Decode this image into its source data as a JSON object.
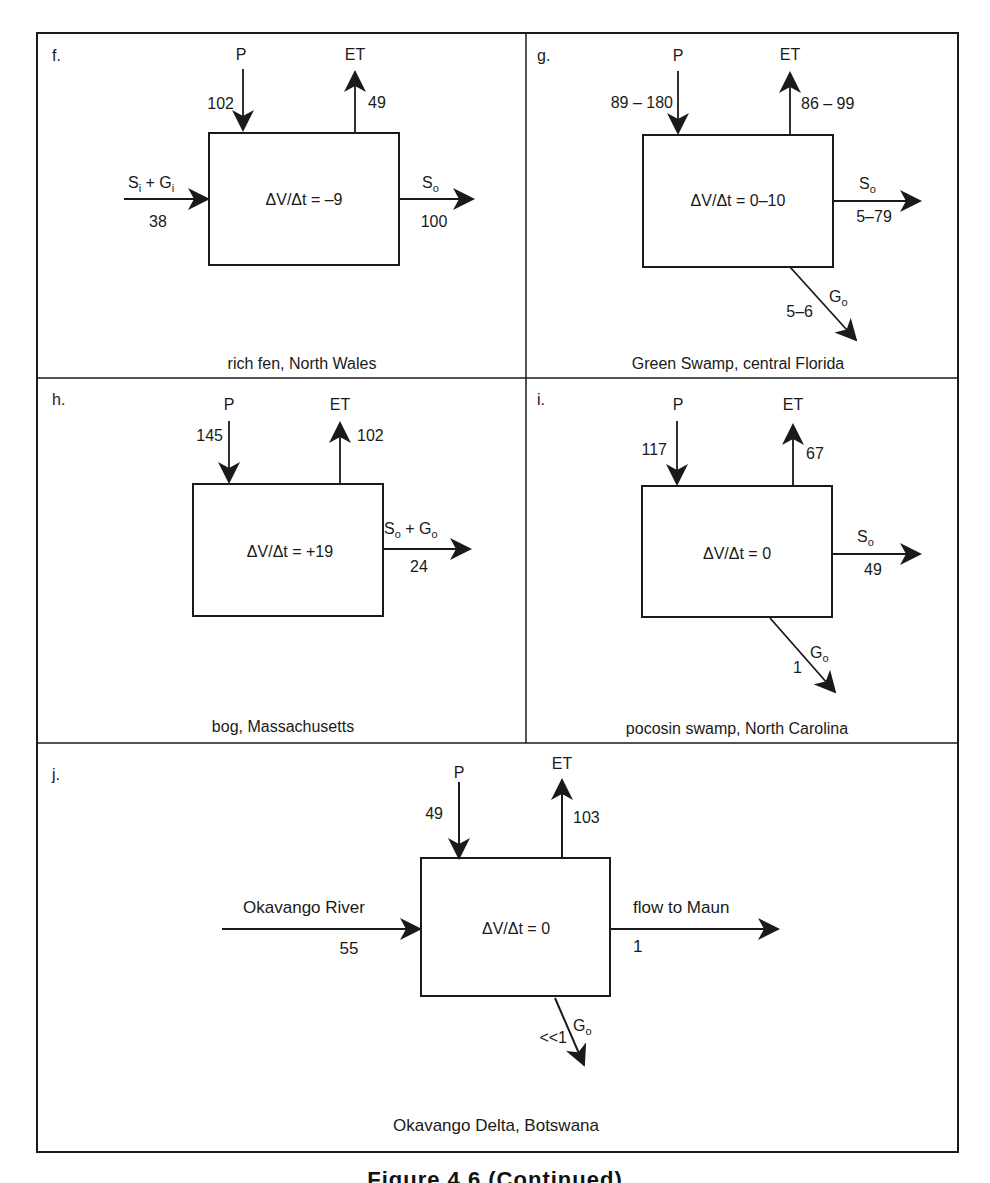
{
  "figure": {
    "caption": "Figure 4.6 (Continued)",
    "panels": [
      {
        "id": "f.",
        "location": "rich fen, North Wales",
        "storage": "ΔV/Δt = –9",
        "P": {
          "label": "P",
          "value": "102"
        },
        "ET": {
          "label": "ET",
          "value": "49"
        },
        "inflow": {
          "label_main1": "S",
          "sub1": "i",
          "plus": " + ",
          "label_main2": "G",
          "sub2": "i",
          "value": "38"
        },
        "outflow": {
          "label_main": "S",
          "sub": "o",
          "value": "100"
        }
      },
      {
        "id": "g.",
        "location": "Green Swamp, central Florida",
        "storage": "ΔV/Δt = 0–10",
        "P": {
          "label": "P",
          "value": "89 – 180"
        },
        "ET": {
          "label": "ET",
          "value": "86 – 99"
        },
        "outflow": {
          "label_main": "S",
          "sub": "o",
          "value": "5–79"
        },
        "groundwater": {
          "label_main": "G",
          "sub": "o",
          "value": "5–6"
        }
      },
      {
        "id": "h.",
        "location": "bog, Massachusetts",
        "storage": "ΔV/Δt = +19",
        "P": {
          "label": "P",
          "value": "145"
        },
        "ET": {
          "label": "ET",
          "value": "102"
        },
        "outflow": {
          "label_main1": "S",
          "sub1": "o",
          "plus": " + ",
          "label_main2": "G",
          "sub2": "o",
          "value": "24"
        }
      },
      {
        "id": "i.",
        "location": "pocosin swamp, North Carolina",
        "storage": "ΔV/Δt = 0",
        "P": {
          "label": "P",
          "value": "117"
        },
        "ET": {
          "label": "ET",
          "value": "67"
        },
        "outflow": {
          "label_main": "S",
          "sub": "o",
          "value": "49"
        },
        "groundwater": {
          "label_main": "G",
          "sub": "o",
          "value": "1"
        }
      },
      {
        "id": "j.",
        "location": "Okavango Delta, Botswana",
        "storage": "ΔV/Δt = 0",
        "P": {
          "label": "P",
          "value": "49"
        },
        "ET": {
          "label": "ET",
          "value": "103"
        },
        "inflow": {
          "label": "Okavango River",
          "value": "55"
        },
        "outflow": {
          "label": "flow to Maun",
          "value": "1"
        },
        "groundwater": {
          "label_main": "G",
          "sub": "o",
          "value": "<<1"
        }
      }
    ]
  },
  "colors": {
    "ink": "#1a1a1a",
    "background": "#ffffff"
  }
}
